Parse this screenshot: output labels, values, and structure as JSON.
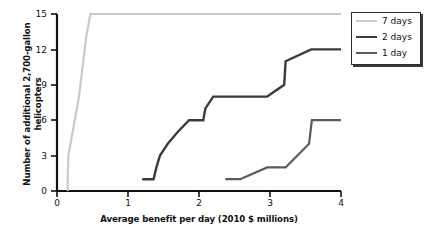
{
  "chart_data": {
    "type": "line",
    "title": "",
    "xlabel": "Average benefit per day (2010 $ millions)",
    "ylabel": "Number of additional 2,700-gallon helicopters",
    "xlim": [
      0,
      4
    ],
    "ylim": [
      0,
      15
    ],
    "xticks": [
      "0",
      "1",
      "2",
      "3",
      "4"
    ],
    "yticks": [
      "0",
      "3",
      "6",
      "9",
      "12",
      "15"
    ],
    "grid": false,
    "legend_position": "right-top",
    "series": [
      {
        "name": "7 days",
        "color": "#c9c9c9",
        "width": 2.2,
        "points": [
          [
            0.15,
            0.0
          ],
          [
            0.15,
            1.0
          ],
          [
            0.16,
            3.0
          ],
          [
            0.19,
            4.0
          ],
          [
            0.22,
            5.0
          ],
          [
            0.25,
            6.0
          ],
          [
            0.28,
            7.0
          ],
          [
            0.31,
            8.0
          ],
          [
            0.33,
            9.0
          ],
          [
            0.35,
            10.0
          ],
          [
            0.37,
            11.0
          ],
          [
            0.39,
            12.0
          ],
          [
            0.41,
            13.0
          ],
          [
            0.44,
            14.0
          ],
          [
            0.47,
            15.0
          ],
          [
            4.0,
            15.0
          ]
        ]
      },
      {
        "name": "2 days",
        "color": "#3c3c3c",
        "width": 2.4,
        "points": [
          [
            1.2,
            1.0
          ],
          [
            1.36,
            1.0
          ],
          [
            1.4,
            2.0
          ],
          [
            1.45,
            3.0
          ],
          [
            1.56,
            4.0
          ],
          [
            1.7,
            5.0
          ],
          [
            1.86,
            6.0
          ],
          [
            2.06,
            6.0
          ],
          [
            2.09,
            7.0
          ],
          [
            2.2,
            8.0
          ],
          [
            2.96,
            8.0
          ],
          [
            3.2,
            9.0
          ],
          [
            3.22,
            11.0
          ],
          [
            3.58,
            12.0
          ],
          [
            4.0,
            12.0
          ]
        ]
      },
      {
        "name": "1 day",
        "color": "#5a5a5a",
        "width": 2.2,
        "points": [
          [
            2.37,
            1.0
          ],
          [
            2.58,
            1.0
          ],
          [
            2.96,
            2.0
          ],
          [
            3.22,
            2.0
          ],
          [
            3.55,
            4.0
          ],
          [
            3.59,
            6.0
          ],
          [
            4.0,
            6.0
          ]
        ]
      }
    ]
  },
  "legend": {
    "items": [
      {
        "label": "7 days"
      },
      {
        "label": "2 days"
      },
      {
        "label": "1 day"
      }
    ]
  }
}
